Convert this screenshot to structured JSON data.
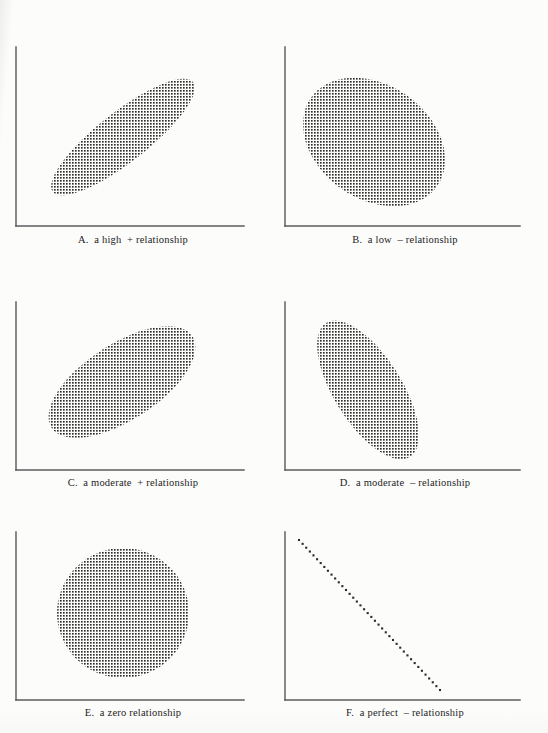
{
  "figure": {
    "background_color": "#fcfcfb",
    "axis_color": "#5d5d60",
    "dot_color": "#2b2b2b"
  },
  "panels": [
    {
      "id": "A",
      "caption": "A.  a high  + relationship",
      "letter": "A",
      "shape": "ellipse",
      "direction": "positive",
      "strength": "high",
      "sign": "+"
    },
    {
      "id": "B",
      "caption": "B.  a low  – relationship",
      "letter": "B",
      "shape": "ellipse",
      "direction": "negative",
      "strength": "low",
      "sign": "–"
    },
    {
      "id": "C",
      "caption": "C.  a moderate  + relationship",
      "letter": "C",
      "shape": "ellipse",
      "direction": "positive",
      "strength": "moderate",
      "sign": "+"
    },
    {
      "id": "D",
      "caption": "D.  a moderate  – relationship",
      "letter": "D",
      "shape": "ellipse",
      "direction": "negative",
      "strength": "moderate",
      "sign": "–"
    },
    {
      "id": "E",
      "caption": "E.  a zero relationship",
      "letter": "E",
      "shape": "circle",
      "direction": "none",
      "strength": "zero",
      "sign": ""
    },
    {
      "id": "F",
      "caption": "F.  a perfect  – relationship",
      "letter": "F",
      "shape": "line",
      "direction": "negative",
      "strength": "perfect",
      "sign": "–"
    }
  ],
  "chart_data": {
    "type": "scatter",
    "xlabel": "",
    "ylabel": "",
    "grid": false,
    "legend": "none",
    "axes": "two-line (left vertical, bottom horizontal), no tick marks, no tick labels",
    "panel_layout": "3 rows x 2 columns",
    "panels": [
      {
        "label": "A",
        "caption": "A.  a high  + relationship",
        "cloud": "ellipse",
        "correlation_sign": "+",
        "correlation_strength": "high",
        "approx_r": 0.9,
        "ellipse": {
          "cx": 123,
          "cy": 137,
          "rx": 88,
          "ry": 24,
          "rotation_deg": -38
        },
        "dot_spacing_px": 3
      },
      {
        "label": "B",
        "caption": "B.  a low  – relationship",
        "cloud": "ellipse",
        "correlation_sign": "–",
        "correlation_strength": "low",
        "approx_r": -0.3,
        "ellipse": {
          "cx": 374,
          "cy": 142,
          "rx": 78,
          "ry": 58,
          "rotation_deg": 35
        },
        "dot_spacing_px": 3
      },
      {
        "label": "C",
        "caption": "C.  a moderate  + relationship",
        "cloud": "ellipse",
        "correlation_sign": "+",
        "correlation_strength": "moderate",
        "approx_r": 0.6,
        "ellipse": {
          "cx": 122,
          "cy": 382,
          "rx": 84,
          "ry": 38,
          "rotation_deg": -33
        },
        "dot_spacing_px": 3
      },
      {
        "label": "D",
        "caption": "D.  a moderate  – relationship",
        "cloud": "ellipse",
        "correlation_sign": "–",
        "correlation_strength": "moderate",
        "approx_r": -0.6,
        "ellipse": {
          "cx": 368,
          "cy": 390,
          "rx": 80,
          "ry": 34,
          "rotation_deg": 58
        },
        "dot_spacing_px": 3
      },
      {
        "label": "E",
        "caption": "E.  a zero relationship",
        "cloud": "circle",
        "correlation_sign": "",
        "correlation_strength": "zero",
        "approx_r": 0.0,
        "ellipse": {
          "cx": 123,
          "cy": 613,
          "rx": 66,
          "ry": 65,
          "rotation_deg": 0
        },
        "dot_spacing_px": 3
      },
      {
        "label": "F",
        "caption": "F.  a perfect  – relationship",
        "cloud": "line",
        "correlation_sign": "–",
        "correlation_strength": "perfect",
        "approx_r": -1.0,
        "line": {
          "x1": 299,
          "y1": 540,
          "x2": 440,
          "y2": 690,
          "n_points": 40
        },
        "dot_spacing_px": 5
      }
    ]
  }
}
